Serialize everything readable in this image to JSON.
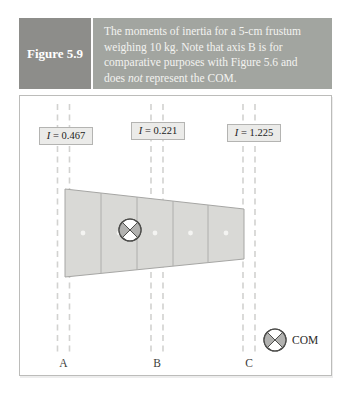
{
  "figure": {
    "label": "Figure 5.9",
    "caption_pre": "The moments of inertia for a 5-cm frustum weighing 10 kg. Note that axis B is for comparative purposes with Figure 5.6 and does ",
    "caption_italic": "not",
    "caption_post": " represent the COM."
  },
  "axes": [
    {
      "name": "A",
      "symbol": "I",
      "equals_value": " = 0.467",
      "inertia": 0.467
    },
    {
      "name": "B",
      "symbol": "I",
      "equals_value": " = 0.221",
      "inertia": 0.221
    },
    {
      "name": "C",
      "symbol": "I",
      "equals_value": " = 1.225",
      "inertia": 1.225
    }
  ],
  "object": {
    "type": "frustum",
    "length_label": "5-cm",
    "mass_label": "10 kg",
    "segments": 5
  },
  "legend": {
    "com_label": "COM"
  },
  "colors": {
    "header_dark": "#8d8d8a",
    "header_light": "#a2a5a0",
    "frustum_fill": "#d9d9d6",
    "com_gray": "#b2b2b0",
    "label_box_bg": "#ebebe9",
    "dashed_axis": "#d2d2d0"
  }
}
